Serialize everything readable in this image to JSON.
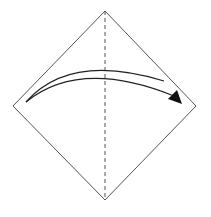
{
  "diagram": {
    "type": "origami-fold-step",
    "paper": {
      "shape": "square-diamond",
      "vertices": {
        "top": [
          105,
          11
        ],
        "right": [
          196,
          106
        ],
        "bottom": [
          105,
          200
        ],
        "left": [
          13,
          106
        ]
      },
      "stroke": "#555555"
    },
    "fold_line": {
      "style": "dashed",
      "orientation": "vertical",
      "from": [
        105,
        11
      ],
      "to": [
        105,
        200
      ],
      "meaning": "valley-fold-center"
    },
    "arrow": {
      "direction": "left-to-right",
      "from": "left-corner",
      "to": "right-corner",
      "color": "#111111",
      "meaning": "fold left corner over to right corner"
    }
  }
}
